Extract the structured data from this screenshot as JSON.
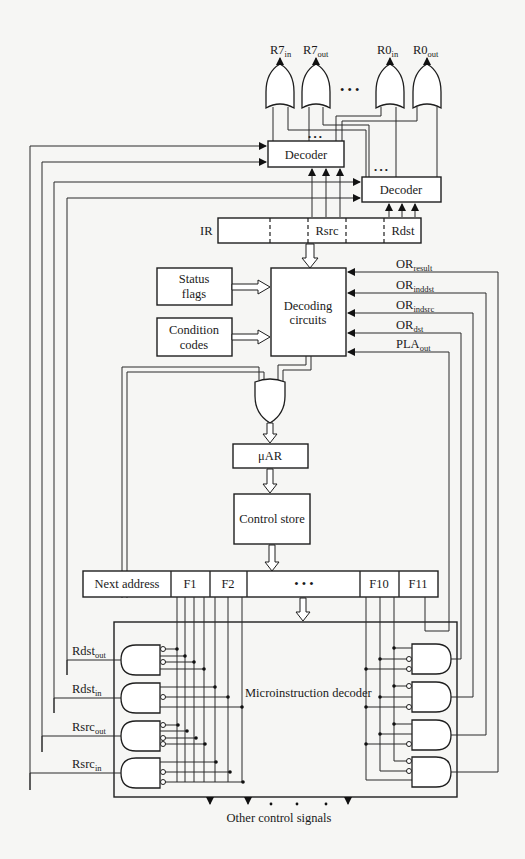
{
  "diagram": {
    "type": "microprogrammed control unit block diagram",
    "register_outputs": [
      {
        "base": "R7",
        "sub": "in"
      },
      {
        "base": "R7",
        "sub": "out"
      },
      {
        "base": "R0",
        "sub": "in"
      },
      {
        "base": "R0",
        "sub": "out"
      }
    ],
    "ellipsis": "• • •",
    "decoder_top": "Decoder",
    "decoder_bottom": "Decoder",
    "ir": {
      "label": "IR",
      "fields": [
        "",
        "",
        "Rsrc",
        "",
        "Rdst"
      ]
    },
    "status_flags": [
      "Status",
      "flags"
    ],
    "condition_codes": [
      "Condition",
      "codes"
    ],
    "decoding_circuits": [
      "Decoding",
      "circuits"
    ],
    "or_signals": [
      {
        "base": "OR",
        "sub": "result"
      },
      {
        "base": "OR",
        "sub": "inddst"
      },
      {
        "base": "OR",
        "sub": "indsrc"
      },
      {
        "base": "OR",
        "sub": "dst"
      },
      {
        "base": "PLA",
        "sub": "out"
      }
    ],
    "uar": "μAR",
    "control_store": "Control store",
    "microinstruction": {
      "fields": [
        "Next address",
        "F1",
        "F2",
        "•   •   •",
        "F10",
        "F11"
      ]
    },
    "microinstruction_decoder": "Microinstruction decoder",
    "gate_outputs": [
      {
        "base": "Rdst",
        "sub": "out"
      },
      {
        "base": "Rdst",
        "sub": "in"
      },
      {
        "base": "Rsrc",
        "sub": "out"
      },
      {
        "base": "Rsrc",
        "sub": "in"
      }
    ],
    "other_signals": "Other control signals"
  }
}
